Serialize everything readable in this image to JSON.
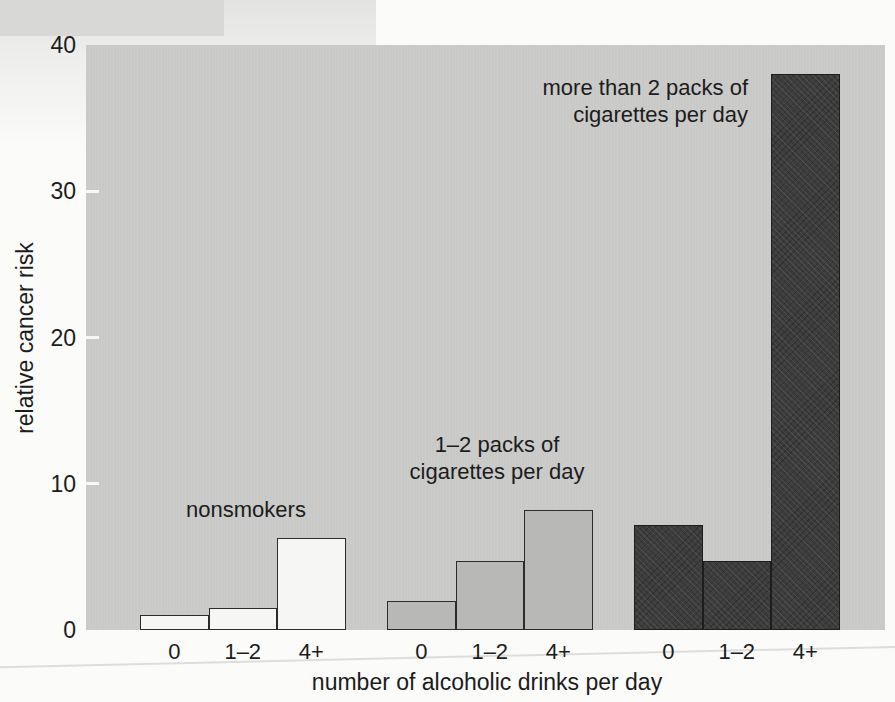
{
  "figure": {
    "page_background": "#fbfbfa",
    "plot_background": "#c9c9c8",
    "text_color": "#1c1c1c",
    "scan_strip_color": "#d8d8d7"
  },
  "chart_data": {
    "type": "bar",
    "title": "",
    "xlabel": "number of alcoholic drinks per day",
    "ylabel": "relative cancer risk",
    "ylim": [
      0,
      40
    ],
    "yticks": [
      40,
      30,
      20,
      10,
      0
    ],
    "grid": false,
    "legend_position": "none",
    "categories": [
      "0",
      "1–2",
      "4+"
    ],
    "series": [
      {
        "name": "nonsmokers",
        "values": [
          1,
          1.5,
          6.3
        ],
        "fill": "#f6f6f4"
      },
      {
        "name": "1–2 packs of cigarettes per day",
        "values": [
          2,
          4.7,
          8.2
        ],
        "fill": "#b8b8b7"
      },
      {
        "name": "more than 2 packs of cigarettes per day",
        "values": [
          7.2,
          4.7,
          38
        ],
        "fill": "#3c3c3c"
      }
    ],
    "annotations": [
      {
        "lines": [
          "nonsmokers"
        ]
      },
      {
        "lines": [
          "1–2 packs of",
          "cigarettes per day"
        ]
      },
      {
        "lines": [
          "more than 2 packs of",
          "cigarettes per day"
        ]
      }
    ]
  }
}
